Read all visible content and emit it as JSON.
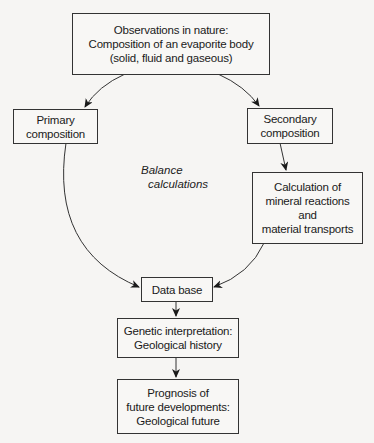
{
  "diagram": {
    "nodes": {
      "observations": {
        "lines": [
          "Observations in nature:",
          "Composition of an evaporite body",
          "(solid, fluid and gaseous)"
        ]
      },
      "primary": {
        "lines": [
          "Primary",
          "composition"
        ]
      },
      "secondary": {
        "lines": [
          "Secondary",
          "composition"
        ]
      },
      "calculation": {
        "lines": [
          "Calculation of",
          "mineral reactions",
          "and",
          "material transports"
        ]
      },
      "database": {
        "lines": [
          "Data base"
        ]
      },
      "genetic": {
        "lines": [
          "Genetic interpretation:",
          "Geological history"
        ]
      },
      "prognosis": {
        "lines": [
          "Prognosis of",
          "future developments:",
          "Geological future"
        ]
      }
    },
    "edge_label": {
      "lines": [
        "Balance",
        "calculations"
      ]
    },
    "edges": [
      {
        "from": "observations",
        "to": "primary"
      },
      {
        "from": "observations",
        "to": "secondary"
      },
      {
        "from": "secondary",
        "to": "calculation"
      },
      {
        "from": "primary",
        "to": "database"
      },
      {
        "from": "calculation",
        "to": "database"
      },
      {
        "from": "database",
        "to": "genetic"
      },
      {
        "from": "genetic",
        "to": "prognosis"
      }
    ],
    "colors": {
      "line": "#333333",
      "background": "#f6f5f3"
    }
  }
}
